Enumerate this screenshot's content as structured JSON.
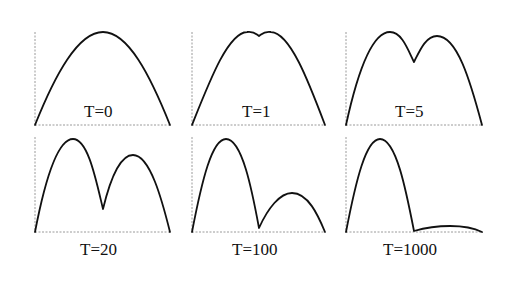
{
  "figure": {
    "panels": [
      {
        "label": "T=0",
        "row": 0,
        "col": 0,
        "shape": "single-peak"
      },
      {
        "label": "T=1",
        "row": 0,
        "col": 1,
        "shape": "slight-double-peak"
      },
      {
        "label": "T=5",
        "row": 0,
        "col": 2,
        "shape": "double-peak"
      },
      {
        "label": "T=20",
        "row": 1,
        "col": 0,
        "shape": "double-peak-deep-dip"
      },
      {
        "label": "T=100",
        "row": 1,
        "col": 1,
        "shape": "double-peak-unequal"
      },
      {
        "label": "T=1000",
        "row": 1,
        "col": 2,
        "shape": "single-peak-with-small-tail"
      }
    ],
    "colors": {
      "curve": "#111111",
      "axis": "#9a9a9a",
      "background": "#ffffff"
    }
  }
}
